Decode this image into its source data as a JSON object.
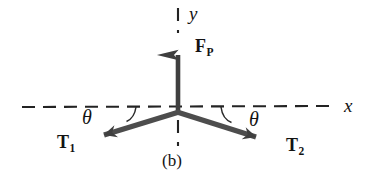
{
  "figure": {
    "caption": "(b)",
    "type": "free-body-diagram",
    "background_color": "#ffffff",
    "ink_color": "#131313",
    "vector_color": "#4a4a4a"
  },
  "axes": {
    "x": {
      "label": "x",
      "style": "dashed",
      "y_pixel": 107,
      "x_start": 22,
      "x_end": 330,
      "label_x": 344,
      "label_y": 97
    },
    "y": {
      "label": "y",
      "style": "dashed",
      "x_pixel": 178,
      "y_top": 8,
      "y_bottom": 32,
      "label_x": 189,
      "label_y": 5
    },
    "origin": {
      "x": 178,
      "y": 112
    },
    "negative_y_stub": {
      "x": 178,
      "y_top": 120,
      "y_bottom": 146
    }
  },
  "vectors": [
    {
      "name": "F_P",
      "label_main": "F",
      "label_sub": "P",
      "direction": "up",
      "tail": {
        "x": 178,
        "y": 112
      },
      "tip": {
        "x": 178,
        "y": 31
      },
      "label_x": 195,
      "label_y": 38
    },
    {
      "name": "T_1",
      "label_main": "T",
      "label_sub": "1",
      "direction": "down-left",
      "tail": {
        "x": 178,
        "y": 112
      },
      "tip": {
        "x": 95,
        "y": 138
      },
      "label_x": 57,
      "label_y": 134
    },
    {
      "name": "T_2",
      "label_main": "T",
      "label_sub": "2",
      "direction": "down-right",
      "tail": {
        "x": 178,
        "y": 112
      },
      "tip": {
        "x": 268,
        "y": 141
      },
      "label_x": 286,
      "label_y": 137
    }
  ],
  "angles": [
    {
      "name": "theta-left",
      "symbol": "θ",
      "between": "negative-x-axis and T_1",
      "label_x": 82,
      "label_y": 108
    },
    {
      "name": "theta-right",
      "symbol": "θ",
      "between": "positive-x-axis and T_2",
      "label_x": 249,
      "label_y": 110
    }
  ]
}
